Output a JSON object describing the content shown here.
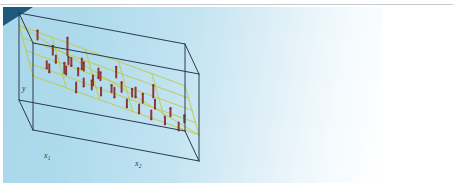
{
  "figure": {
    "kind": "3d-scatter-with-fitted-plane",
    "panel_background": "#b4dcee",
    "page_background": "#ffffff",
    "corner_mark_color": "#1d5a7c",
    "top_rule_color": "#b9c2c9"
  },
  "axes": {
    "vertical": {
      "label": "y",
      "subscript": ""
    },
    "depth": {
      "label": "x",
      "subscript": "1"
    },
    "horizontal": {
      "label": "x",
      "subscript": "2"
    }
  },
  "style": {
    "box_color": "#2b3a4a",
    "box_width": 1.0,
    "plane_color": "#c3c83c",
    "plane_width": 0.9,
    "stem_color": "#8c2f2f",
    "stem_width": 2.0
  },
  "chart_data": {
    "type": "scatter",
    "title": "",
    "xlabel": "x2",
    "ylabel": "y",
    "zlabel": "x1",
    "grid": true,
    "legend": null,
    "projection": {
      "origin": [
        33,
        130
      ],
      "x2_axis_vector": [
        166,
        31
      ],
      "x1_axis_vector": [
        -14,
        -30
      ],
      "y_axis_vector": [
        0,
        -87
      ],
      "ranges": {
        "x1": [
          0,
          1
        ],
        "x2": [
          0,
          1
        ],
        "y": [
          0,
          1
        ]
      }
    },
    "plane": {
      "mesh_divisions_x1": 4,
      "mesh_divisions_x2": 5,
      "corners_unit": [
        [
          0,
          0
        ],
        [
          1,
          0
        ],
        [
          1,
          1
        ],
        [
          0,
          1
        ]
      ],
      "height_at_corners": [
        0.62,
        0.3,
        0.52,
        0.86
      ]
    },
    "points": [
      {
        "x1": 0.86,
        "x2": 0.1,
        "y_plane": 0.78,
        "y_obs": 0.88
      },
      {
        "x1": 0.6,
        "x2": 0.17,
        "y_plane": 0.72,
        "y_obs": 0.82
      },
      {
        "x1": 0.62,
        "x2": 0.19,
        "y_plane": 0.71,
        "y_obs": 0.63
      },
      {
        "x1": 0.74,
        "x2": 0.27,
        "y_plane": 0.7,
        "y_obs": 0.9
      },
      {
        "x1": 0.7,
        "x2": 0.29,
        "y_plane": 0.69,
        "y_obs": 0.6
      },
      {
        "x1": 0.55,
        "x2": 0.26,
        "y_plane": 0.66,
        "y_obs": 0.74
      },
      {
        "x1": 0.48,
        "x2": 0.24,
        "y_plane": 0.65,
        "y_obs": 0.56
      },
      {
        "x1": 0.44,
        "x2": 0.12,
        "y_plane": 0.68,
        "y_obs": 0.6
      },
      {
        "x1": 0.38,
        "x2": 0.13,
        "y_plane": 0.67,
        "y_obs": 0.58
      },
      {
        "x1": 0.33,
        "x2": 0.3,
        "y_plane": 0.62,
        "y_obs": 0.7
      },
      {
        "x1": 0.29,
        "x2": 0.33,
        "y_plane": 0.61,
        "y_obs": 0.52
      },
      {
        "x1": 0.52,
        "x2": 0.35,
        "y_plane": 0.63,
        "y_obs": 0.72
      },
      {
        "x1": 0.46,
        "x2": 0.4,
        "y_plane": 0.61,
        "y_obs": 0.5
      },
      {
        "x1": 0.4,
        "x2": 0.44,
        "y_plane": 0.59,
        "y_obs": 0.68
      },
      {
        "x1": 0.24,
        "x2": 0.43,
        "y_plane": 0.56,
        "y_obs": 0.47
      },
      {
        "x1": 0.2,
        "x2": 0.49,
        "y_plane": 0.54,
        "y_obs": 0.62
      },
      {
        "x1": 0.35,
        "x2": 0.52,
        "y_plane": 0.55,
        "y_obs": 0.44
      },
      {
        "x1": 0.31,
        "x2": 0.56,
        "y_plane": 0.53,
        "y_obs": 0.64
      },
      {
        "x1": 0.17,
        "x2": 0.58,
        "y_plane": 0.5,
        "y_obs": 0.41
      },
      {
        "x1": 0.27,
        "x2": 0.62,
        "y_plane": 0.51,
        "y_obs": 0.6
      },
      {
        "x1": 0.13,
        "x2": 0.65,
        "y_plane": 0.48,
        "y_obs": 0.38
      },
      {
        "x1": 0.22,
        "x2": 0.68,
        "y_plane": 0.48,
        "y_obs": 0.58
      },
      {
        "x1": 0.09,
        "x2": 0.72,
        "y_plane": 0.45,
        "y_obs": 0.35
      },
      {
        "x1": 0.18,
        "x2": 0.75,
        "y_plane": 0.45,
        "y_obs": 0.55
      },
      {
        "x1": 0.06,
        "x2": 0.8,
        "y_plane": 0.42,
        "y_obs": 0.33
      },
      {
        "x1": 0.14,
        "x2": 0.84,
        "y_plane": 0.41,
        "y_obs": 0.5
      },
      {
        "x1": 0.03,
        "x2": 0.88,
        "y_plane": 0.39,
        "y_obs": 0.3
      },
      {
        "x1": 0.1,
        "x2": 0.92,
        "y_plane": 0.38,
        "y_obs": 0.46
      },
      {
        "x1": 0.66,
        "x2": 0.45,
        "y_plane": 0.64,
        "y_obs": 0.53
      },
      {
        "x1": 0.58,
        "x2": 0.55,
        "y_plane": 0.6,
        "y_obs": 0.72
      },
      {
        "x1": 0.5,
        "x2": 0.66,
        "y_plane": 0.55,
        "y_obs": 0.44
      },
      {
        "x1": 0.42,
        "x2": 0.76,
        "y_plane": 0.5,
        "y_obs": 0.64
      },
      {
        "x1": 0.78,
        "x2": 0.36,
        "y_plane": 0.68,
        "y_obs": 0.56
      },
      {
        "x1": 0.25,
        "x2": 0.21,
        "y_plane": 0.64,
        "y_obs": 0.76
      },
      {
        "x1": 0.12,
        "x2": 0.27,
        "y_plane": 0.6,
        "y_obs": 0.49
      },
      {
        "x1": 0.07,
        "x2": 0.36,
        "y_plane": 0.57,
        "y_obs": 0.67
      }
    ]
  }
}
